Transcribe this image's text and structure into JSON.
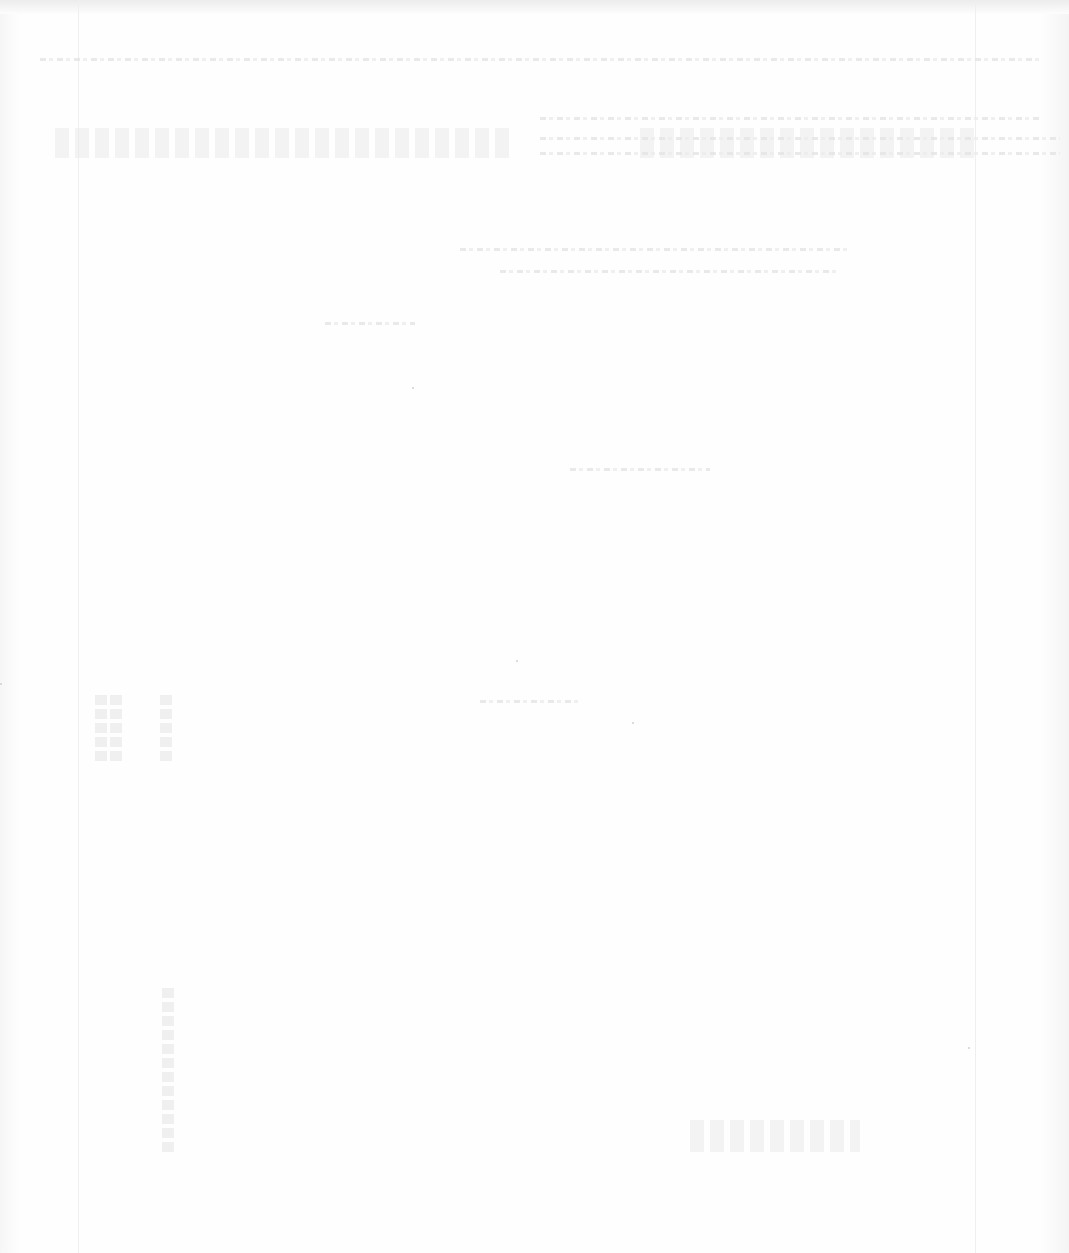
{
  "document": {
    "type": "scanned-page",
    "legibility": "illegible",
    "background_color": "#fdfdfd",
    "ink_color": "#e4e4e4"
  }
}
